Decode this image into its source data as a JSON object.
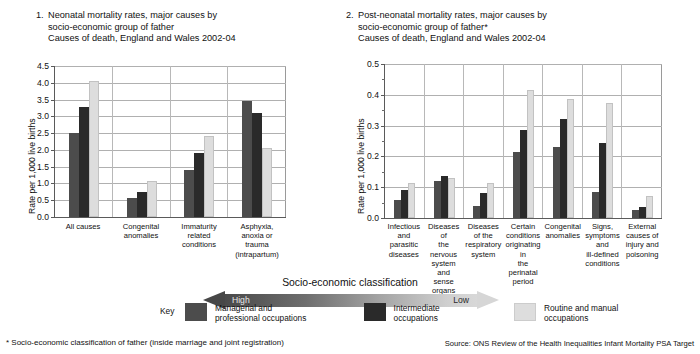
{
  "charts": [
    {
      "number": "1.",
      "title_lines": [
        "Neonatal mortality rates, major causes by",
        "socio-economic group of father",
        "Causes of death, England and Wales 2002-04"
      ],
      "ylabel": "Rate per 1,000 live births",
      "chart_data": {
        "type": "bar",
        "title": "Neonatal mortality rates, major causes by socio-economic group of father",
        "subtitle": "Causes of death, England and Wales 2002-04",
        "xlabel": "",
        "ylabel": "Rate per 1,000 live births",
        "ylim": [
          0.0,
          4.5
        ],
        "ytick_values": [
          0.0,
          0.5,
          1.0,
          1.5,
          2.0,
          2.5,
          3.0,
          3.5,
          4.0,
          4.5
        ],
        "ytick_labels": [
          "0.0",
          "0.5",
          "1.0",
          "1.5",
          "2.0",
          "2.5",
          "3.0",
          "3.5",
          "4.0",
          "4.5"
        ],
        "grid": true,
        "legend_position": "bottom",
        "categories": [
          "All causes",
          "Congenital anomalies",
          "Immaturity related conditions",
          "Asphyxia, anoxia or trauma (intrapartum)"
        ],
        "category_lines": [
          [
            "All causes"
          ],
          [
            "Congenital",
            "anomalies"
          ],
          [
            "Immaturity",
            "related",
            "conditions"
          ],
          [
            "Asphyxia,",
            "anoxia or trauma",
            "(intrapartum)"
          ]
        ],
        "series": [
          {
            "name": "Managerial and professional occupations",
            "color": "#4c4c4c",
            "values": [
              2.5,
              0.58,
              1.4,
              3.45
            ]
          },
          {
            "name": "Intermediate occupations",
            "color": "#2a2a2a",
            "values": [
              3.27,
              0.75,
              1.9,
              3.1
            ]
          },
          {
            "name": "Routine and manual occupations",
            "color": "#dddddd",
            "values": [
              4.05,
              1.07,
              2.4,
              2.05
            ]
          }
        ]
      }
    },
    {
      "number": "2.",
      "title_lines": [
        "Post-neonatal mortality rates, major causes by",
        "socio-economic group of father*",
        "Causes of death, England and Wales 2002-04"
      ],
      "ylabel": "Rate per 1,000 live births",
      "chart_data": {
        "type": "bar",
        "title": "Post-neonatal mortality rates, major causes by socio-economic group of father*",
        "subtitle": "Causes of death, England and Wales 2002-04",
        "xlabel": "",
        "ylabel": "Rate per 1,000 live births",
        "ylim": [
          0.0,
          0.5
        ],
        "ytick_values": [
          0.0,
          0.1,
          0.2,
          0.3,
          0.4,
          0.5
        ],
        "ytick_labels": [
          "0.0",
          "0.1",
          "0.2",
          "0.3",
          "0.4",
          "0.5"
        ],
        "minor_tick_step": 0.05,
        "grid": true,
        "legend_position": "bottom",
        "categories": [
          "Infectious and parasitic diseases",
          "Diseases of the nervous system and sense organs",
          "Diseases of the respiratory system",
          "Certain conditions originating in the perinatal period",
          "Congenital anomalies",
          "Signs, symptoms and ill-defined conditions",
          "External causes of injury and poisoning"
        ],
        "category_lines": [
          [
            "Infectious",
            "and parasitic",
            "diseases"
          ],
          [
            "Diseases of",
            "the nervous",
            "system and",
            "sense organs"
          ],
          [
            "Diseases",
            "of the",
            "respiratory",
            "system"
          ],
          [
            "Certain",
            "conditions",
            "originating in",
            "the perinatal",
            "period"
          ],
          [
            "Congenital",
            "anomalies"
          ],
          [
            "Signs,",
            "symptoms",
            "and",
            "ill-defined",
            "conditions"
          ],
          [
            "External",
            "causes of",
            "injury and",
            "poisoning"
          ]
        ],
        "series": [
          {
            "name": "Managerial and professional occupations",
            "color": "#4c4c4c",
            "values": [
              0.06,
              0.12,
              0.04,
              0.215,
              0.23,
              0.085,
              0.025
            ]
          },
          {
            "name": "Intermediate occupations",
            "color": "#2a2a2a",
            "values": [
              0.09,
              0.135,
              0.08,
              0.285,
              0.32,
              0.245,
              0.035
            ]
          },
          {
            "name": "Routine and manual occupations",
            "color": "#dddddd",
            "values": [
              0.115,
              0.13,
              0.115,
              0.415,
              0.385,
              0.375,
              0.07
            ]
          }
        ]
      }
    }
  ],
  "classification": {
    "title": "Socio-economic classification",
    "high_label": "High",
    "low_label": "Low"
  },
  "key": {
    "label": "Key",
    "items": [
      {
        "swatch": "#4c4c4c",
        "lines": [
          "Managerial and",
          "professional occupations"
        ]
      },
      {
        "swatch": "#2a2a2a",
        "lines": [
          "Intermediate",
          "occupations"
        ]
      },
      {
        "swatch": "#dddddd",
        "lines": [
          "Routine and manual",
          "occupations"
        ]
      }
    ]
  },
  "footnote": "* Socio-economic classification of father (inside marriage and joint registration)",
  "source": "Source: ONS Review of the Health Inequalities Infant Mortality PSA Target"
}
